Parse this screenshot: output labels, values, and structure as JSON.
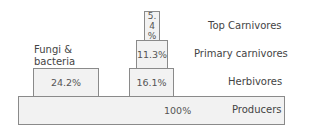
{
  "diagram": {
    "type": "energy-pyramid",
    "levels": [
      {
        "name": "Top Carnivores",
        "value": "5.4 %"
      },
      {
        "name": "Primary carnivores",
        "value": "11.3%"
      },
      {
        "name": "Herbivores",
        "value": "16.1%"
      },
      {
        "name": "Producers",
        "value": "100%"
      }
    ],
    "side": {
      "name": "Fungi & bacteria",
      "name_line1": "Fungi &",
      "name_line2": "bacteria",
      "value": "24.2%"
    }
  }
}
